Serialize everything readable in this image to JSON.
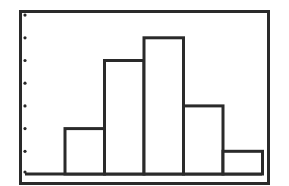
{
  "chart_data": {
    "type": "bar",
    "subtype": "histogram",
    "title": "",
    "xlabel": "",
    "ylabel": "",
    "categories": [
      "bin1",
      "bin2",
      "bin3",
      "bin4",
      "bin5",
      "bin6"
    ],
    "values": [
      0,
      2,
      5,
      6,
      3,
      1
    ],
    "ylim": [
      0,
      7
    ],
    "y_ticks": [
      1,
      2,
      3,
      4,
      5,
      6,
      7
    ],
    "y_tick_style": "dots",
    "grid": false,
    "legend": null,
    "colors": {
      "stroke": "#2a2a2a",
      "fill": "#ffffff",
      "background": "#ffffff"
    }
  }
}
